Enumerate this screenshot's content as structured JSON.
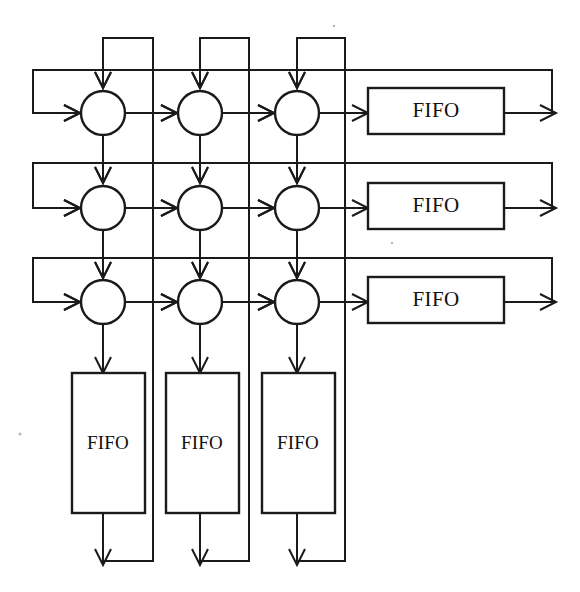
{
  "diagram": {
    "canvas": {
      "width": 580,
      "height": 592,
      "background": "#ffffff"
    },
    "stroke_color": "#1a1a1a",
    "fill_color": "#ffffff",
    "rows": 3,
    "columns": 3,
    "processing_elements": [
      {
        "id": "pe-r1c1",
        "row": 1,
        "col": 1,
        "cx": 103,
        "cy": 113,
        "r": 22
      },
      {
        "id": "pe-r1c2",
        "row": 1,
        "col": 2,
        "cx": 200,
        "cy": 113,
        "r": 22
      },
      {
        "id": "pe-r1c3",
        "row": 1,
        "col": 3,
        "cx": 297,
        "cy": 113,
        "r": 22
      },
      {
        "id": "pe-r2c1",
        "row": 2,
        "col": 1,
        "cx": 103,
        "cy": 208,
        "r": 22
      },
      {
        "id": "pe-r2c2",
        "row": 2,
        "col": 2,
        "cx": 200,
        "cy": 208,
        "r": 22
      },
      {
        "id": "pe-r2c3",
        "row": 2,
        "col": 3,
        "cx": 297,
        "cy": 208,
        "r": 22
      },
      {
        "id": "pe-r3c1",
        "row": 3,
        "col": 1,
        "cx": 103,
        "cy": 302,
        "r": 22
      },
      {
        "id": "pe-r3c2",
        "row": 3,
        "col": 2,
        "cx": 200,
        "cy": 302,
        "r": 22
      },
      {
        "id": "pe-r3c3",
        "row": 3,
        "col": 3,
        "cx": 297,
        "cy": 302,
        "r": 22
      }
    ],
    "row_fifos": [
      {
        "id": "fifo-row-1",
        "label": "FIFO",
        "x": 368,
        "y": 88,
        "width": 136,
        "height": 46,
        "orientation": "horizontal"
      },
      {
        "id": "fifo-row-2",
        "label": "FIFO",
        "x": 368,
        "y": 183,
        "width": 136,
        "height": 46,
        "orientation": "horizontal"
      },
      {
        "id": "fifo-row-3",
        "label": "FIFO",
        "x": 368,
        "y": 277,
        "width": 136,
        "height": 46,
        "orientation": "horizontal"
      }
    ],
    "column_fifos": [
      {
        "id": "fifo-col-1",
        "label": "FIFO",
        "x": 72,
        "y": 373,
        "width": 73,
        "height": 140,
        "orientation": "vertical"
      },
      {
        "id": "fifo-col-2",
        "label": "FIFO",
        "x": 166,
        "y": 373,
        "width": 73,
        "height": 140,
        "orientation": "vertical"
      },
      {
        "id": "fifo-col-3",
        "label": "FIFO",
        "x": 262,
        "y": 373,
        "width": 73,
        "height": 140,
        "orientation": "vertical"
      }
    ],
    "row_feedback_lines": [
      {
        "id": "row-wrap-1",
        "top_y": 70,
        "left_x": 33,
        "right_x": 552,
        "enter_y": 113
      },
      {
        "id": "row-wrap-2",
        "top_y": 163,
        "left_x": 33,
        "right_x": 552,
        "enter_y": 208
      },
      {
        "id": "row-wrap-3",
        "top_y": 258,
        "left_x": 33,
        "right_x": 552,
        "enter_y": 302
      }
    ],
    "column_feedback_lines": [
      {
        "id": "col-wrap-1",
        "up_x": 153,
        "top_y": 38,
        "enter_x": 103,
        "bottom_y": 561
      },
      {
        "id": "col-wrap-2",
        "up_x": 249,
        "top_y": 38,
        "enter_x": 200,
        "bottom_y": 561
      },
      {
        "id": "col-wrap-3",
        "up_x": 345,
        "top_y": 38,
        "enter_x": 297,
        "bottom_y": 561
      }
    ],
    "labels": {
      "fifo": "FIFO"
    }
  }
}
